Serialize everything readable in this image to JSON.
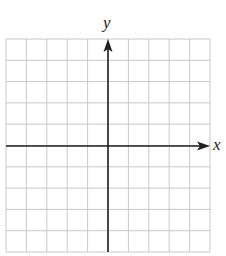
{
  "diagram": {
    "type": "coordinate-grid",
    "grid": {
      "columns": 10,
      "rows": 10,
      "line_color": "#c8c8c8",
      "axis_color": "#231f20"
    },
    "axes": {
      "x_label": "x",
      "y_label": "y",
      "x_arrow": "right",
      "y_arrow": "up"
    }
  }
}
